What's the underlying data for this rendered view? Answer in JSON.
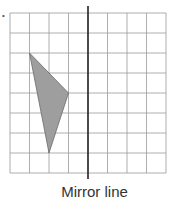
{
  "figure": {
    "bullet": "•",
    "caption": "Mirror line",
    "grid": {
      "cols": 8,
      "rows": 8,
      "x0": 10,
      "y0": 13,
      "cell_w": 19.5,
      "cell_h": 20,
      "line_color": "#9a9a9a"
    },
    "mirror_line": {
      "x_col": 4,
      "y_top": 6,
      "y_bottom": 179,
      "color": "#3a3a3a"
    },
    "triangle": {
      "vertices_grid": [
        [
          1,
          2
        ],
        [
          3,
          4
        ],
        [
          2,
          7
        ]
      ],
      "fill": "#9e9e9e",
      "stroke": "#6a6a6a"
    }
  }
}
